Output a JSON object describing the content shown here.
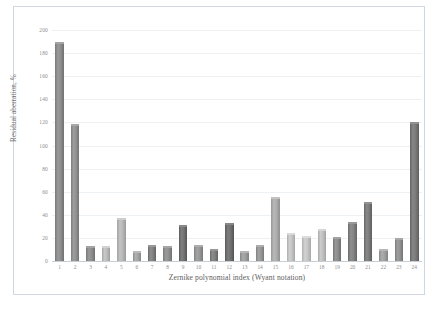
{
  "chart_data": {
    "type": "bar",
    "title": "",
    "xlabel": "Zernike polynomial index (Wyant notation)",
    "ylabel": "Residual aberration, %",
    "categories": [
      "1",
      "2",
      "3",
      "4",
      "5",
      "6",
      "7",
      "8",
      "9",
      "10",
      "11",
      "12",
      "13",
      "14",
      "15",
      "16",
      "17",
      "18",
      "19",
      "20",
      "21",
      "22",
      "23",
      "24"
    ],
    "values": [
      190,
      119,
      13,
      13,
      37,
      9,
      14,
      13,
      31,
      14,
      10,
      33,
      9,
      14,
      55,
      24,
      22,
      28,
      21,
      34,
      51,
      10,
      20,
      120
    ],
    "bar_colors": [
      "#8a8a8a",
      "#8e8e8e",
      "#8a8a8a",
      "#b8b8b8",
      "#b4b4b4",
      "#a0a0a0",
      "#7e7e7e",
      "#8c8c8c",
      "#6f6f6f",
      "#949494",
      "#7c7c7c",
      "#6d6d6d",
      "#9a9a9a",
      "#939393",
      "#a9a9a9",
      "#c0c0c0",
      "#c2c2c2",
      "#bcbcbc",
      "#888888",
      "#7f7f7f",
      "#787878",
      "#9d9d9d",
      "#8e8e8e",
      "#777777"
    ],
    "ylim": [
      0,
      200
    ],
    "yticks": [
      "0",
      "20",
      "40",
      "60",
      "80",
      "100",
      "120",
      "140",
      "160",
      "180",
      "200"
    ],
    "ytick_values": [
      0,
      20,
      40,
      60,
      80,
      100,
      120,
      140,
      160,
      180,
      200
    ],
    "grid": true,
    "legend": "none",
    "frame_color": "#cfd8e2",
    "gridline_color": "#eef1f4",
    "tick_label_color": "#8d8d8d",
    "axis_title_color": "#5e5e5e",
    "background": "#ffffff"
  }
}
